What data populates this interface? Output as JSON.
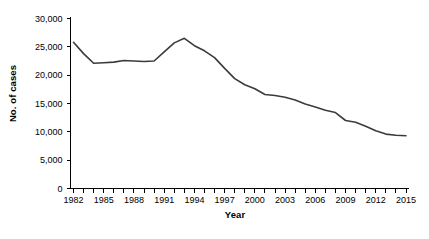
{
  "chart_data": {
    "type": "line",
    "title": "",
    "xlabel": "Year",
    "ylabel": "No. of cases",
    "xlim": [
      1982,
      2015
    ],
    "ylim": [
      0,
      30000
    ],
    "grid": false,
    "legend": null,
    "x_tick_labels": [
      "1982",
      "1985",
      "1988",
      "1991",
      "1994",
      "1997",
      "2000",
      "2003",
      "2006",
      "2009",
      "2012",
      "2015"
    ],
    "x_tick_values": [
      1982,
      1985,
      1988,
      1991,
      1994,
      1997,
      2000,
      2003,
      2006,
      2009,
      2012,
      2015
    ],
    "x_minor_ticks_every": 1,
    "y_tick_labels": [
      "30,000",
      "25,000",
      "20,000",
      "15,000",
      "10,000",
      "5,000",
      "0"
    ],
    "y_tick_values": [
      30000,
      25000,
      20000,
      15000,
      10000,
      5000,
      0
    ],
    "series": [
      {
        "name": "No. of cases",
        "color": "#3b3b3b",
        "x": [
          1982,
          1983,
          1984,
          1985,
          1986,
          1987,
          1988,
          1989,
          1990,
          1991,
          1992,
          1993,
          1994,
          1995,
          1996,
          1997,
          1998,
          1999,
          2000,
          2001,
          2002,
          2003,
          2004,
          2005,
          2006,
          2007,
          2008,
          2009,
          2010,
          2011,
          2012,
          2013,
          2014,
          2015
        ],
        "values": [
          25800,
          23800,
          22100,
          22200,
          22300,
          22600,
          22500,
          22400,
          22500,
          24100,
          25700,
          26500,
          25200,
          24300,
          23100,
          21200,
          19400,
          18300,
          17600,
          16600,
          16400,
          16100,
          15600,
          14900,
          14400,
          13800,
          13400,
          12000,
          11700,
          11000,
          10200,
          9600,
          9400,
          9300
        ]
      }
    ]
  },
  "axes": {
    "y_title": "No. of cases",
    "x_title": "Year"
  }
}
